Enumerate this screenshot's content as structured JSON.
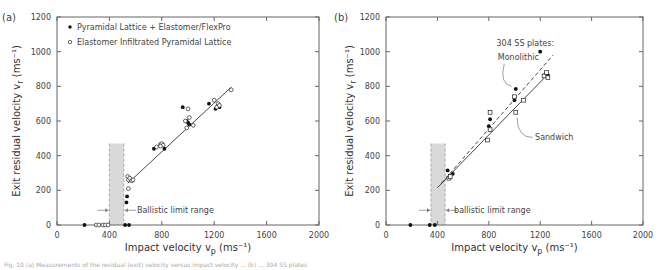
{
  "caption": "Fig. 10 (a) Measurements of the residual (exit) velocity versus impact velocity ... (b) ... 304 SS plates",
  "chart_data": [
    {
      "panel_label": "(a)",
      "type": "scatter",
      "title": "",
      "xlabel": "Impact velocity  v_p (ms⁻¹)",
      "ylabel": "Exit residual velocity  v_r (ms⁻¹)",
      "xlim": [
        0,
        2000
      ],
      "ylim": [
        0,
        1200
      ],
      "xticks": [
        0,
        400,
        800,
        1200,
        1600,
        2000
      ],
      "yticks": [
        0,
        200,
        400,
        600,
        800,
        1000,
        1200
      ],
      "grid": false,
      "legend_position": "upper left",
      "series": [
        {
          "name": "Pyramidal Lattice + Elastomer/FlexPro",
          "marker": "filled-circle",
          "points": [
            [
              210,
              0
            ],
            [
              520,
              0
            ],
            [
              550,
              0
            ],
            [
              530,
              130
            ],
            [
              535,
              165
            ],
            [
              740,
              440
            ],
            [
              820,
              440
            ],
            [
              960,
              680
            ],
            [
              990,
              600
            ],
            [
              1010,
              580
            ],
            [
              1000,
              590
            ],
            [
              1160,
              700
            ],
            [
              1210,
              670
            ],
            [
              1230,
              690
            ],
            [
              1240,
              680
            ]
          ]
        },
        {
          "name": "Elastomer Infiltrated Pyramidal Lattice",
          "marker": "open-circle",
          "points": [
            [
              300,
              0
            ],
            [
              320,
              0
            ],
            [
              350,
              0
            ],
            [
              370,
              0
            ],
            [
              390,
              0
            ],
            [
              540,
              280
            ],
            [
              545,
              260
            ],
            [
              555,
              270
            ],
            [
              570,
              255
            ],
            [
              580,
              260
            ],
            [
              545,
              210
            ],
            [
              760,
              450
            ],
            [
              790,
              465
            ],
            [
              800,
              470
            ],
            [
              810,
              460
            ],
            [
              790,
              455
            ],
            [
              1000,
              670
            ],
            [
              1010,
              620
            ],
            [
              980,
              600
            ],
            [
              1040,
              575
            ],
            [
              990,
              560
            ],
            [
              1200,
              720
            ],
            [
              1230,
              700
            ],
            [
              1220,
              680
            ],
            [
              1240,
              690
            ],
            [
              1330,
              780
            ]
          ]
        }
      ],
      "fit_lines": [
        {
          "name": "fit",
          "style": "solid",
          "from": [
            540,
            240
          ],
          "to": [
            1330,
            795
          ]
        }
      ],
      "shaded_band": {
        "x_from": 400,
        "x_to": 510,
        "y_to": 470,
        "color": "#d9d9d9"
      },
      "annotations": [
        {
          "text": "Ballistic limit range",
          "x": 610,
          "y": 85
        }
      ]
    },
    {
      "panel_label": "(b)",
      "type": "scatter",
      "title": "",
      "xlabel": "Impact velocity  v_p  (ms⁻¹)",
      "ylabel": "Exit residual velocity  v_r (ms⁻¹)",
      "xlim": [
        0,
        2000
      ],
      "ylim": [
        0,
        1200
      ],
      "xticks": [
        0,
        400,
        800,
        1200,
        1600,
        2000
      ],
      "yticks": [
        0,
        200,
        400,
        600,
        800,
        1000,
        1200
      ],
      "grid": false,
      "series": [
        {
          "name": "Monolithic",
          "marker": "filled-circle",
          "points": [
            [
              190,
              0
            ],
            [
              340,
              0
            ],
            [
              380,
              0
            ],
            [
              480,
              315
            ],
            [
              520,
              295
            ],
            [
              800,
              570
            ],
            [
              810,
              610
            ],
            [
              1000,
              720
            ],
            [
              1010,
              785
            ],
            [
              1200,
              1000
            ],
            [
              1240,
              870
            ],
            [
              1260,
              865
            ]
          ]
        },
        {
          "name": "Sandwich",
          "marker": "open-square",
          "points": [
            [
              490,
              270
            ],
            [
              500,
              280
            ],
            [
              790,
              490
            ],
            [
              810,
              550
            ],
            [
              810,
              650
            ],
            [
              1000,
              740
            ],
            [
              1070,
              720
            ],
            [
              1010,
              650
            ],
            [
              1230,
              860
            ],
            [
              1260,
              850
            ],
            [
              1250,
              880
            ]
          ]
        }
      ],
      "fit_lines": [
        {
          "name": "Monolithic fit",
          "style": "dashed",
          "from": [
            430,
            240
          ],
          "to": [
            1300,
            980
          ]
        },
        {
          "name": "Sandwich fit",
          "style": "solid",
          "from": [
            400,
            215
          ],
          "to": [
            1260,
            870
          ]
        }
      ],
      "shaded_band": {
        "x_from": 350,
        "x_to": 460,
        "y_to": 470,
        "color": "#d9d9d9"
      },
      "annotations": [
        {
          "text": "304 SS plates:",
          "x": 860,
          "y": 1050
        },
        {
          "text": "Monolithic",
          "x": 870,
          "y": 970
        },
        {
          "text": "Sandwich",
          "x": 1160,
          "y": 510
        },
        {
          "text": "ballistic limit range",
          "x": 530,
          "y": 85
        }
      ]
    }
  ]
}
